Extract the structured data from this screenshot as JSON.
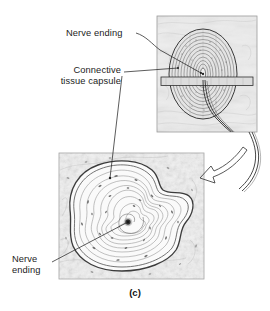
{
  "figure": {
    "caption": "(c)",
    "panels": [
      {
        "id": "schematic",
        "name": "schematic-illustration-panel",
        "description": "Line drawing of a lamellated (Pacinian) corpuscle sectioned by a horizontal plane, with nerve fibers exiting at lower right",
        "x": 157,
        "y": 16,
        "width": 100,
        "height": 116,
        "background_color": "#ebebeb",
        "border_color": "#9a9a9a"
      },
      {
        "id": "micrograph",
        "name": "light-micrograph-panel",
        "description": "Light micrograph of a Pacinian corpuscle showing concentric lamellae of the connective tissue capsule around a central nerve ending",
        "x": 59,
        "y": 153,
        "width": 145,
        "height": 126,
        "background_color": "#f2f2f2",
        "border_color": "#a2a2a2"
      }
    ]
  },
  "labels": {
    "nerve_ending_top": "Nerve ending",
    "connective_capsule_line1": "Connective",
    "connective_capsule_line2": "tissue capsule",
    "nerve_ending_bottom_line1": "Nerve",
    "nerve_ending_bottom_line2": "ending"
  },
  "annotations": {
    "zoom_arrow": {
      "name": "magnification-arrow",
      "description": "Curved open arrow pointing from the schematic panel down-left to the micrograph panel"
    },
    "leader_lines": [
      {
        "name": "leader-nerve-ending-top",
        "from_label": "Nerve ending",
        "to": "center of corpuscle in schematic panel"
      },
      {
        "name": "leader-connective-tissue-capsule-schematic",
        "from_label": "Connective tissue capsule",
        "to": "outer lamellae at left of schematic corpuscle"
      },
      {
        "name": "leader-connective-tissue-capsule-micrograph",
        "from_label": "Connective tissue capsule",
        "to": "outer lamellae at top of micrograph corpuscle"
      },
      {
        "name": "leader-nerve-ending-bottom",
        "from_label": "Nerve ending",
        "to": "dark central core of micrograph corpuscle"
      }
    ]
  },
  "colors": {
    "ink": "#1c1c1c",
    "leader_line": "#2b2b2b",
    "panel_fill_schematic": "#ebebeb",
    "panel_fill_micrograph": "#f2f2f2",
    "panel_border": "#9a9a9a",
    "page_background": "#ffffff"
  }
}
